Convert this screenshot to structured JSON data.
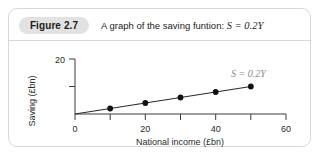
{
  "figure": {
    "badge_label": "Figure 2.7",
    "title_text": "A graph of the saving funtion: ",
    "title_equation": "S = 0.2Y"
  },
  "colors": {
    "badge_background": "#e2e2e2",
    "card_border": "#d8d8d8",
    "axis": "#3c3c3c",
    "line": "#2a2a2a",
    "marker": "#111111",
    "series_label": "#8a8a8a"
  },
  "chart_data": {
    "type": "line",
    "title": "A graph of the saving funtion: S = 0.2Y",
    "xlabel": "National income (£bn)",
    "ylabel": "Saving (£bn)",
    "xlim": [
      0,
      60
    ],
    "ylim": [
      0,
      20
    ],
    "grid": false,
    "legend": "none",
    "x_ticks": [
      0,
      10,
      20,
      30,
      40,
      50,
      60
    ],
    "x_tick_labels": [
      "0",
      "",
      "20",
      "",
      "40",
      "",
      "60"
    ],
    "y_ticks": [
      0,
      10,
      20
    ],
    "y_tick_labels": [
      "",
      "",
      "20"
    ],
    "annotations": [
      {
        "text": "S = 0.2Y",
        "x": 46,
        "y": 13.5
      }
    ],
    "series": [
      {
        "name": "S = 0.2Y",
        "x": [
          0,
          10,
          20,
          30,
          40,
          50
        ],
        "values": [
          0,
          2,
          4,
          6,
          8,
          10
        ],
        "markers_at": [
          10,
          20,
          30,
          40,
          50
        ]
      }
    ]
  }
}
